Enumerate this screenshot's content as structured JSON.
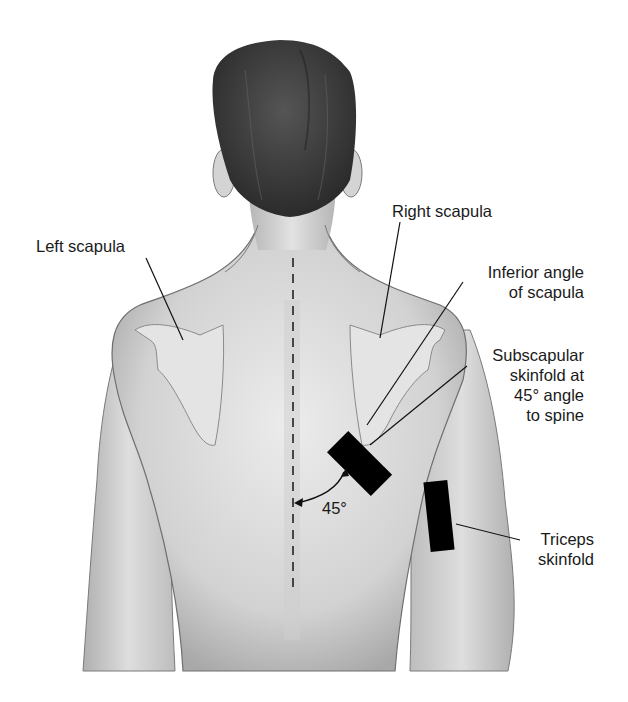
{
  "figure": {
    "colors": {
      "background": "#ffffff",
      "skin_light": "#e6e6e6",
      "skin_shadow": "#a9a9a9",
      "hair": "#3c3c3c",
      "caliper_marks": "#000000",
      "text": "#1a1a1a"
    }
  },
  "labels": {
    "left_scapula": "Left scapula",
    "right_scapula": "Right scapula",
    "inferior_angle": [
      "Inferior angle",
      "of scapula"
    ],
    "subscapular": [
      "Subscapular",
      "skinfold at",
      "45° angle",
      "to spine"
    ],
    "triceps": [
      "Triceps",
      "skinfold"
    ],
    "angle": "45°"
  },
  "markers": {
    "subscapular_site": {
      "shape": "rectangle",
      "rotation_deg": 45
    },
    "triceps_site": {
      "shape": "rectangle",
      "orientation": "vertical"
    },
    "spine_line": {
      "style": "dashed"
    }
  }
}
